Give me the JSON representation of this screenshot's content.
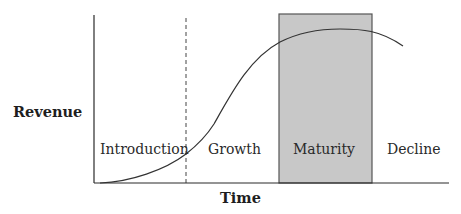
{
  "diagram": {
    "y_axis_label": "Revenue",
    "x_axis_label": "Time",
    "stages": [
      {
        "name": "Introduction"
      },
      {
        "name": "Growth"
      },
      {
        "name": "Maturity",
        "highlighted": true
      },
      {
        "name": "Decline"
      }
    ],
    "colors": {
      "axis": "#2a2a2a",
      "curve": "#333333",
      "highlight_fill": "#c8c8c8",
      "highlight_stroke": "#555555",
      "background": "#ffffff"
    }
  }
}
